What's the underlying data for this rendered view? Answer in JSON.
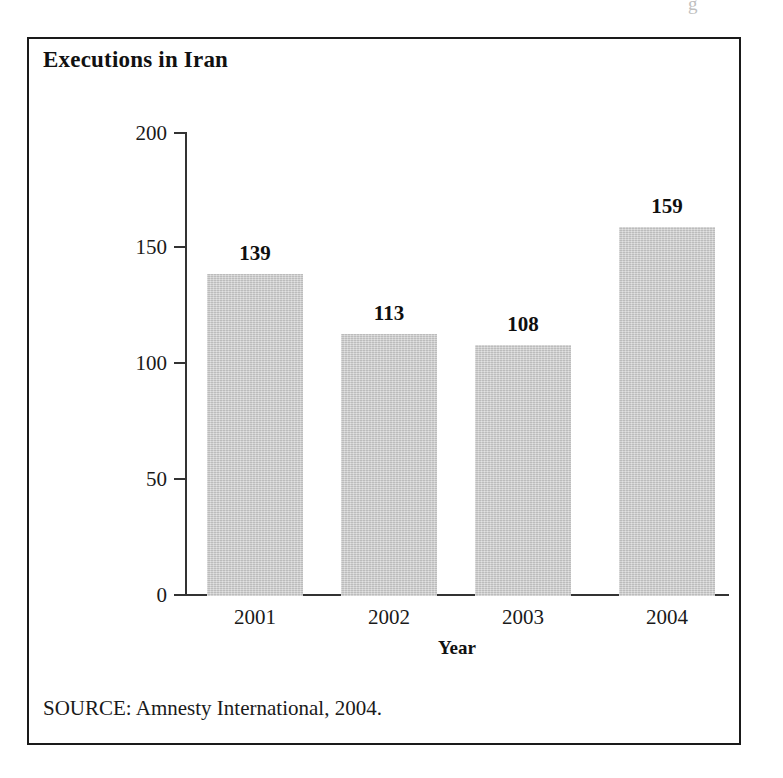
{
  "figure": {
    "title": "Executions in Iran",
    "source": "SOURCE: Amnesty International, 2004.",
    "scan_artifact": "g",
    "frame_color": "#1a1a1a"
  },
  "chart_data": {
    "type": "bar",
    "title": "Executions in Iran",
    "categories": [
      "2001",
      "2002",
      "2003",
      "2004"
    ],
    "values": [
      139,
      113,
      108,
      159
    ],
    "value_labels": [
      "139",
      "113",
      "108",
      "159"
    ],
    "xlabel": "Year",
    "ylabel": "Number of executions",
    "ylim": [
      0,
      200
    ],
    "yticks": [
      0,
      50,
      100,
      150,
      200
    ],
    "ytick_labels": [
      "0",
      "50",
      "100",
      "150",
      "200"
    ],
    "grid": false,
    "legend": null,
    "bar_color": "#c9c9c9",
    "axis_color": "#333333",
    "source": "SOURCE: Amnesty International, 2004."
  }
}
